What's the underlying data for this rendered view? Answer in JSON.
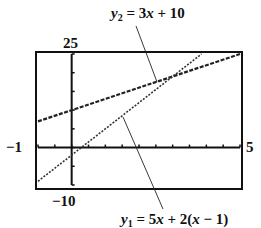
{
  "chart_data": {
    "type": "line",
    "title": "",
    "xlabel": "",
    "ylabel": "",
    "xlim": [
      -1,
      5
    ],
    "ylim": [
      -10,
      25
    ],
    "xscale_ticks": 0.5,
    "yscale_ticks": 5,
    "grid": false,
    "legend": "none (callout annotations)",
    "window_labels": {
      "xmin": "−1",
      "xmax": "5",
      "ymin": "−10",
      "ymax": "25"
    },
    "series": [
      {
        "name": "y2 = 3x + 10",
        "label_var": "y",
        "label_sub": "2",
        "label_rest": " = 3x + 10",
        "slope": 3,
        "intercept": 10,
        "x": [
          -1,
          5
        ],
        "y": [
          7,
          25
        ],
        "style": "dashed-thick"
      },
      {
        "name": "y1 = 5x + 2(x − 1)",
        "label_var": "y",
        "label_sub": "1",
        "label_rest": " = 5x + 2(x − 1)",
        "slope": 7,
        "intercept": -2,
        "x": [
          -1,
          3.857
        ],
        "y": [
          -9,
          25
        ],
        "style": "dotted"
      }
    ],
    "annotations": [
      {
        "text": "y2 = 3x + 10",
        "points_to": "line y2 near intersection"
      },
      {
        "text": "y1 = 5x + 2(x − 1)",
        "points_to": "line y1 near x = 2"
      }
    ],
    "intersection": {
      "x": 3,
      "y": 19
    }
  }
}
